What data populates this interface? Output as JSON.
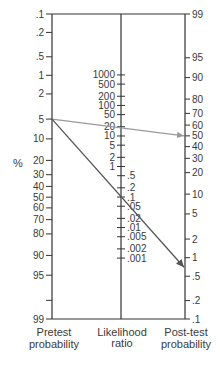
{
  "chart_data": {
    "type": "line",
    "subtype": "Fagan nomogram",
    "title": "",
    "ylabel": "%",
    "grid": false,
    "colors": {
      "axis": "#333333",
      "text": "#3a3a3a",
      "gray_arrow": "#9a9a9a",
      "dark_arrow": "#555555"
    },
    "axes": [
      {
        "name": "Pretest probability",
        "label_lines": [
          "Pretest",
          "probability"
        ],
        "unit": "%",
        "range": [
          0.1,
          99
        ],
        "ticks": [
          {
            "value": 0.1,
            "label": ".1"
          },
          {
            "value": 0.2,
            "label": ".2"
          },
          {
            "value": 0.5,
            "label": ".5"
          },
          {
            "value": 1,
            "label": "1"
          },
          {
            "value": 2,
            "label": "2"
          },
          {
            "value": 5,
            "label": "5"
          },
          {
            "value": 10,
            "label": "10"
          },
          {
            "value": 20,
            "label": "20"
          },
          {
            "value": 30,
            "label": "30"
          },
          {
            "value": 40,
            "label": "40"
          },
          {
            "value": 50,
            "label": "50"
          },
          {
            "value": 60,
            "label": "60"
          },
          {
            "value": 70,
            "label": "70"
          },
          {
            "value": 80,
            "label": "80"
          },
          {
            "value": 90,
            "label": "90"
          },
          {
            "value": 95,
            "label": "95"
          },
          {
            "value": 98,
            "label": ""
          },
          {
            "value": 99,
            "label": "99"
          }
        ]
      },
      {
        "name": "Likelihood ratio",
        "label_lines": [
          "Likelihood",
          "ratio"
        ],
        "range": [
          0.001,
          1000
        ],
        "ticks": [
          {
            "value": 1000,
            "label": "1000"
          },
          {
            "value": 500,
            "label": "500"
          },
          {
            "value": 200,
            "label": "200"
          },
          {
            "value": 100,
            "label": "100"
          },
          {
            "value": 50,
            "label": "50"
          },
          {
            "value": 20,
            "label": "20"
          },
          {
            "value": 10,
            "label": "10"
          },
          {
            "value": 5,
            "label": "5"
          },
          {
            "value": 2,
            "label": "2"
          },
          {
            "value": 1,
            "label": "1"
          },
          {
            "value": 0.5,
            "label": ".5"
          },
          {
            "value": 0.2,
            "label": ".2"
          },
          {
            "value": 0.1,
            "label": ".1"
          },
          {
            "value": 0.05,
            "label": ".05"
          },
          {
            "value": 0.02,
            "label": ".02"
          },
          {
            "value": 0.01,
            "label": ".01"
          },
          {
            "value": 0.005,
            "label": ".005"
          },
          {
            "value": 0.002,
            "label": ".002"
          },
          {
            "value": 0.001,
            "label": ".001"
          }
        ]
      },
      {
        "name": "Post-test probability",
        "label_lines": [
          "Post-test",
          "probability"
        ],
        "unit": "%",
        "range": [
          99,
          0.1
        ],
        "ticks": [
          {
            "value": 99,
            "label": "99"
          },
          {
            "value": 95,
            "label": "95"
          },
          {
            "value": 90,
            "label": "90"
          },
          {
            "value": 80,
            "label": "80"
          },
          {
            "value": 70,
            "label": "70"
          },
          {
            "value": 60,
            "label": "60"
          },
          {
            "value": 50,
            "label": "50"
          },
          {
            "value": 40,
            "label": "40"
          },
          {
            "value": 30,
            "label": "30"
          },
          {
            "value": 20,
            "label": "20"
          },
          {
            "value": 10,
            "label": "10"
          },
          {
            "value": 5,
            "label": "5"
          },
          {
            "value": 2,
            "label": "2"
          },
          {
            "value": 1,
            "label": "1"
          },
          {
            "value": 0.5,
            "label": ".5"
          },
          {
            "value": 0.2,
            "label": ".2"
          },
          {
            "value": 0.1,
            "label": ".1"
          }
        ]
      }
    ],
    "series": [
      {
        "name": "gray-arrow",
        "color": "#9a9a9a",
        "pretest": 5,
        "likelihood_ratio": 20,
        "posttest": 50
      },
      {
        "name": "dark-arrow",
        "color": "#555555",
        "pretest": 5,
        "likelihood_ratio": 0.1,
        "posttest": 0.7
      }
    ]
  }
}
